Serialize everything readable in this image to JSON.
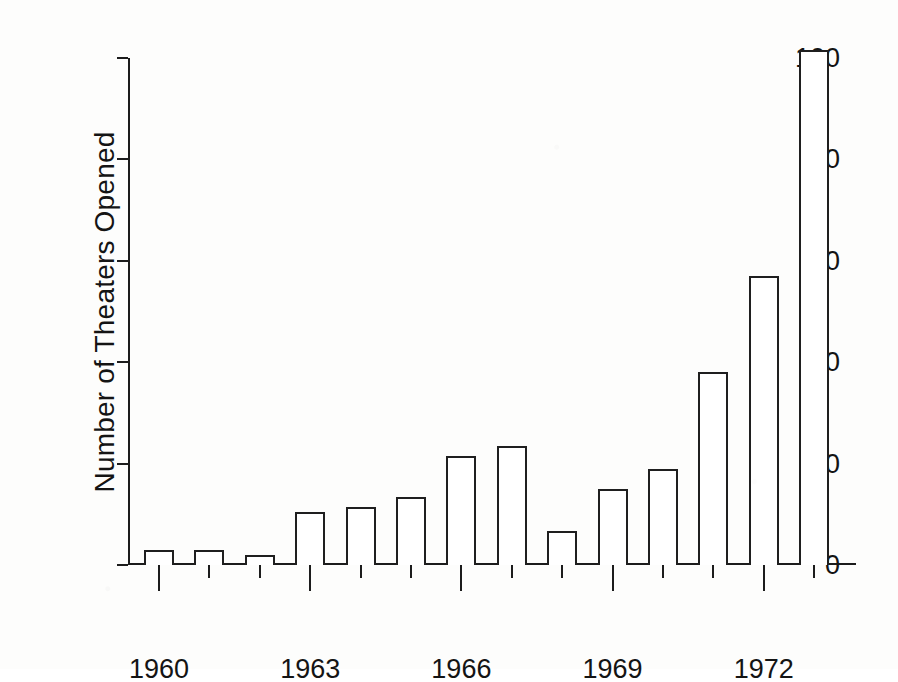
{
  "chart_data": {
    "type": "bar",
    "title": "",
    "subtitle": "",
    "xlabel": "",
    "ylabel": "Number of Theaters Opened",
    "categories": [
      1960,
      1961,
      1962,
      1963,
      1964,
      1965,
      1966,
      1967,
      1968,
      1969,
      1970,
      1971,
      1972,
      1973
    ],
    "values": [
      3,
      3,
      2,
      10.5,
      11.5,
      13.5,
      21.5,
      23.5,
      6.8,
      15,
      19,
      38,
      57,
      101.5
    ],
    "series": [
      {
        "name": "Theaters Opened",
        "values": [
          3,
          3,
          2,
          10.5,
          11.5,
          13.5,
          21.5,
          23.5,
          6.8,
          15,
          19,
          38,
          57,
          101.5
        ]
      }
    ],
    "ylim": [
      0,
      105
    ],
    "yticks": [
      0,
      20,
      40,
      60,
      80,
      100
    ],
    "ytick_labels": [
      "0",
      "20",
      "40",
      "60",
      "80",
      "100"
    ],
    "xtick_major_labels": [
      "1960",
      "1963",
      "1966",
      "1969",
      "1972"
    ],
    "xtick_major_values": [
      1960,
      1963,
      1966,
      1969,
      1972
    ],
    "grid": false,
    "legend": false,
    "legend_position": "none",
    "bar_fill": "#ffffff",
    "bar_edge_color": "#1f1f1f",
    "axis_color": "#1c1c1c",
    "background_color": "#fdfdfc"
  },
  "figure": {
    "ylabel": "Number of Theaters Opened"
  }
}
